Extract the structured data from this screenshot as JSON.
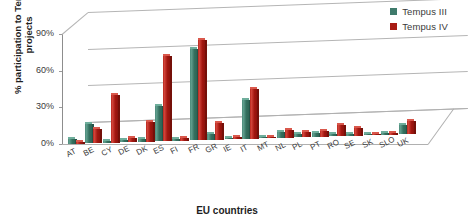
{
  "chart_data": {
    "type": "bar",
    "title": "",
    "xlabel": "EU countries",
    "ylabel": "% participation to Tempus projects",
    "ylim": [
      0,
      90
    ],
    "yticks": [
      "0%",
      "30%",
      "60%",
      "90%"
    ],
    "grid": true,
    "legend_position": "top-right",
    "three_d": true,
    "categories": [
      "AT",
      "BE",
      "CY",
      "DE",
      "DK",
      "ES",
      "FI",
      "FR",
      "GR",
      "IE",
      "IT",
      "MT",
      "NL",
      "PL",
      "PT",
      "RO",
      "SE",
      "SK",
      "SLO",
      "UK"
    ],
    "series": [
      {
        "name": "Tempus III",
        "color": "#3E7A6B",
        "values": [
          4,
          16,
          2,
          1,
          2,
          29,
          1,
          75,
          5,
          0,
          32,
          0,
          5,
          3,
          3,
          1,
          0,
          0,
          1,
          7
        ]
      },
      {
        "name": "Tempus IV",
        "color": "#A81C14",
        "values": [
          2,
          12,
          39,
          4,
          16,
          70,
          2,
          82,
          14,
          1,
          41,
          0,
          6,
          4,
          5,
          9,
          6,
          0,
          1,
          11
        ]
      }
    ]
  },
  "legend": {
    "items": [
      {
        "label": "Tempus III",
        "color": "#3E7A6B"
      },
      {
        "label": "Tempus IV",
        "color": "#A81C14"
      }
    ]
  },
  "axes": {
    "y_title": "% participation to Tempus projects",
    "x_title": "EU countries",
    "y_ticks": [
      "90%",
      "60%",
      "30%",
      "0%"
    ]
  }
}
